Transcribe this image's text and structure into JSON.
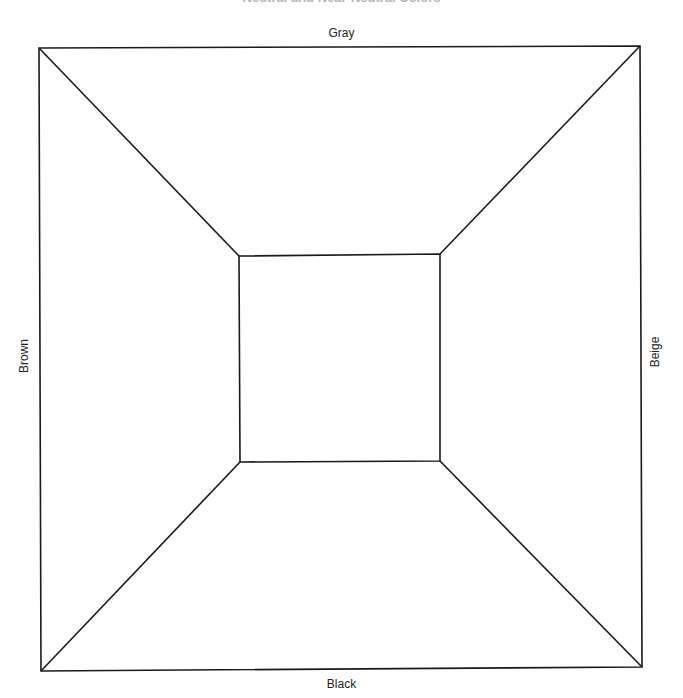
{
  "title": "Neutral and Near-Neutral Colors",
  "labels": {
    "top": "Gray",
    "right": "Beige",
    "bottom": "Black",
    "left": "Brown"
  },
  "colors": {
    "line": "#1a1a1a",
    "label": "#222222",
    "title": "#b5b5b5",
    "background": "#ffffff"
  },
  "geometry": {
    "outer": {
      "top_left": [
        39,
        48
      ],
      "top_right": [
        640,
        46
      ],
      "bottom_right": [
        642,
        667
      ],
      "bottom_left": [
        41,
        671
      ]
    },
    "inner": {
      "top_left": [
        239,
        256
      ],
      "top_right": [
        440,
        254
      ],
      "bottom_right": [
        440,
        461
      ],
      "bottom_left": [
        240,
        462
      ]
    }
  }
}
